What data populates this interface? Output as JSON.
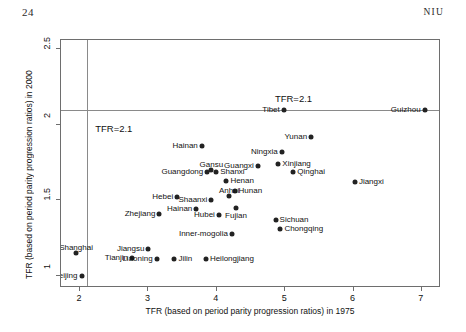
{
  "page": {
    "folio": "24",
    "running_head": "NIU"
  },
  "chart_data": {
    "type": "scatter",
    "title": "",
    "xlabel": "TFR (based on period parity progression ratios) in 1975",
    "ylabel": "TFR (based on period parity progression ratios) in 2000",
    "xlim": [
      1.72,
      7.28
    ],
    "ylim": [
      0.92,
      2.56
    ],
    "xticks": [
      2,
      3,
      4,
      5,
      6,
      7
    ],
    "xticklabels": [
      "2",
      "3",
      "4",
      "5",
      "6",
      "7"
    ],
    "yticks": [
      1,
      1.5,
      2,
      2.5
    ],
    "yticklabels": [
      "1",
      "1.5",
      "2",
      "2.5"
    ],
    "grid": false,
    "legend": null,
    "marker_color": "#222222",
    "reference_lines": [
      {
        "orientation": "horizontal",
        "value": 2.1,
        "label": "TFR=2.1",
        "color": "#8a8a8a"
      },
      {
        "orientation": "vertical",
        "value": 2.1,
        "label": "TFR=2.1",
        "color": "#8a8a8a"
      }
    ],
    "annotations": [
      {
        "text": "TFR=2.1",
        "x": 4.85,
        "y": 2.17
      },
      {
        "text": "TFR=2.1",
        "x": 2.22,
        "y": 1.97
      }
    ],
    "points": [
      {
        "label": "Guizhou",
        "x": 7.04,
        "y": 2.1,
        "label_side": "left"
      },
      {
        "label": "Tibet",
        "x": 4.98,
        "y": 2.1,
        "label_side": "left"
      },
      {
        "label": "Yunan",
        "x": 5.38,
        "y": 1.92,
        "label_side": "left"
      },
      {
        "label": "Ningxia",
        "x": 4.95,
        "y": 1.82,
        "label_side": "left"
      },
      {
        "label": "Xinjiang",
        "x": 4.9,
        "y": 1.74,
        "label_side": "right"
      },
      {
        "label": "Guangxi",
        "x": 4.6,
        "y": 1.73,
        "label_side": "left"
      },
      {
        "label": "Qinghai",
        "x": 5.12,
        "y": 1.69,
        "label_side": "right"
      },
      {
        "label": "Jiangxi",
        "x": 6.02,
        "y": 1.62,
        "label_side": "right"
      },
      {
        "label": "Hainan",
        "x": 3.78,
        "y": 1.86,
        "label_side": "left"
      },
      {
        "label": "Gansu",
        "x": 3.92,
        "y": 1.7,
        "label_side": "above"
      },
      {
        "label": "Guangdong",
        "x": 3.86,
        "y": 1.69,
        "label_side": "left"
      },
      {
        "label": "Shanxi",
        "x": 3.99,
        "y": 1.69,
        "label_side": "right"
      },
      {
        "label": "Henan",
        "x": 4.14,
        "y": 1.63,
        "label_side": "right"
      },
      {
        "label": "Hunan",
        "x": 4.26,
        "y": 1.56,
        "label_side": "right"
      },
      {
        "label": "Anhui",
        "x": 4.18,
        "y": 1.53,
        "label_side": "above"
      },
      {
        "label": "Shaanxi",
        "x": 3.92,
        "y": 1.5,
        "label_side": "left"
      },
      {
        "label": "Fujian",
        "x": 4.28,
        "y": 1.45,
        "label_side": "below"
      },
      {
        "label": "Hebei",
        "x": 3.42,
        "y": 1.52,
        "label_side": "left"
      },
      {
        "label": "Hainan2",
        "x": 3.7,
        "y": 1.44,
        "label_side": "left",
        "display": "Hainan"
      },
      {
        "label": "Hubei",
        "x": 4.03,
        "y": 1.4,
        "label_side": "left"
      },
      {
        "label": "Zhejiang",
        "x": 3.16,
        "y": 1.41,
        "label_side": "left"
      },
      {
        "label": "Sichuan",
        "x": 4.86,
        "y": 1.37,
        "label_side": "right"
      },
      {
        "label": "Chongqing",
        "x": 4.93,
        "y": 1.31,
        "label_side": "right"
      },
      {
        "label": "Inner-mogolia",
        "x": 4.22,
        "y": 1.28,
        "label_side": "left"
      },
      {
        "label": "Jiangsu",
        "x": 3.0,
        "y": 1.18,
        "label_side": "left"
      },
      {
        "label": "Tianjin",
        "x": 2.76,
        "y": 1.12,
        "label_side": "left"
      },
      {
        "label": "Liaoning",
        "x": 3.12,
        "y": 1.11,
        "label_side": "left"
      },
      {
        "label": "Jilin",
        "x": 3.38,
        "y": 1.11,
        "label_side": "right"
      },
      {
        "label": "Heilongjiang",
        "x": 3.84,
        "y": 1.11,
        "label_side": "right"
      },
      {
        "label": "Shanghai",
        "x": 1.94,
        "y": 1.15,
        "label_side": "above"
      },
      {
        "label": "Beijing",
        "x": 2.02,
        "y": 1.0,
        "label_side": "left"
      }
    ]
  }
}
